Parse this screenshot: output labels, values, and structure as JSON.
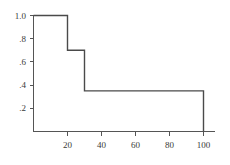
{
  "chart_data": {
    "type": "line",
    "title": "",
    "subtitle": "",
    "xlabel": "",
    "ylabel": "",
    "xlim": [
      0,
      115
    ],
    "ylim": [
      0,
      1.05
    ],
    "grid": false,
    "legend": null,
    "step_style": "post",
    "x": [
      0,
      20,
      20,
      30,
      30,
      100,
      100
    ],
    "y": [
      1.0,
      1.0,
      0.7,
      0.7,
      0.35,
      0.35,
      0.0
    ],
    "series": [
      {
        "name": "survival",
        "points": [
          {
            "x": 0,
            "y": 1.0
          },
          {
            "x": 20,
            "y": 1.0
          },
          {
            "x": 20,
            "y": 0.7
          },
          {
            "x": 30,
            "y": 0.7
          },
          {
            "x": 30,
            "y": 0.35
          },
          {
            "x": 100,
            "y": 0.35
          },
          {
            "x": 100,
            "y": 0.0
          }
        ]
      }
    ],
    "steps": [
      {
        "from_x": 0,
        "to_x": 20,
        "level": 1.0
      },
      {
        "from_x": 20,
        "to_x": 30,
        "level": 0.7
      },
      {
        "from_x": 30,
        "to_x": 100,
        "level": 0.35
      },
      {
        "from_x": 100,
        "to_x": 100,
        "level": 0.0
      }
    ],
    "xticks": [
      20,
      40,
      60,
      80,
      100
    ],
    "xticklabels": [
      "20",
      "40",
      "60",
      "80",
      "100"
    ],
    "yticks": [
      0.2,
      0.4,
      0.6,
      0.8,
      1.0
    ],
    "yticklabels": [
      ".2",
      ".4",
      ".6",
      ".8",
      "1.0"
    ],
    "line_color": "#4a4a4a",
    "axis_color": "#555555"
  },
  "axes": {
    "y": {
      "labels": [
        "1.0",
        ".8",
        ".6",
        ".4",
        ".2"
      ],
      "values": [
        1.0,
        0.8,
        0.6,
        0.4,
        0.2
      ]
    },
    "x": {
      "labels": [
        "20",
        "40",
        "60",
        "80",
        "100"
      ],
      "values": [
        20,
        40,
        60,
        80,
        100
      ]
    }
  }
}
